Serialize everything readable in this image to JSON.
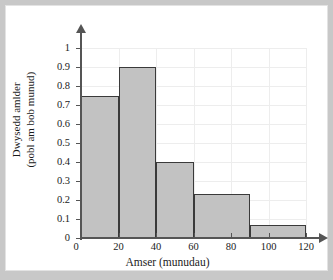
{
  "chart_data": {
    "type": "bar",
    "title": "",
    "subtitle": "",
    "xlabel": "Amser (munudau)",
    "ylabel_line1": "Dwysedd amlder",
    "ylabel_line2": "(pobl am bob munud)",
    "ylabel": "Dwysedd amlder (pobl am bob munud)",
    "xlim": [
      0,
      120
    ],
    "ylim": [
      0,
      1.0
    ],
    "grid": true,
    "legend": "none",
    "xticks": [
      0,
      20,
      40,
      60,
      80,
      100,
      120
    ],
    "xtick_labels": [
      "0",
      "20",
      "40",
      "60",
      "80",
      "100",
      "120"
    ],
    "yticks": [
      0,
      0.1,
      0.2,
      0.3,
      0.4,
      0.5,
      0.6,
      0.7,
      0.8,
      0.9,
      1.0
    ],
    "ytick_labels": [
      "0",
      "0.1",
      "0.2",
      "0.3",
      "0.4",
      "0.5",
      "0.6",
      "0.7",
      "0.8",
      "0.9",
      "1"
    ],
    "bar_fill_color": "#c2c2c2",
    "bar_edge_color": "#3a3a3a",
    "gridline_color": "#ededed",
    "axis_color": "#555555",
    "bins": [
      {
        "label": "0-20",
        "x_start": 0,
        "x_end": 20,
        "value": 0.75
      },
      {
        "label": "20-40",
        "x_start": 20,
        "x_end": 40,
        "value": 0.9
      },
      {
        "label": "40-60",
        "x_start": 40,
        "x_end": 60,
        "value": 0.4
      },
      {
        "label": "60-90",
        "x_start": 60,
        "x_end": 90,
        "value": 0.23
      },
      {
        "label": "90-120",
        "x_start": 90,
        "x_end": 120,
        "value": 0.07
      }
    ],
    "categories": [
      "0-20",
      "20-40",
      "40-60",
      "60-90",
      "90-120"
    ],
    "values": [
      0.75,
      0.9,
      0.4,
      0.23,
      0.07
    ]
  }
}
